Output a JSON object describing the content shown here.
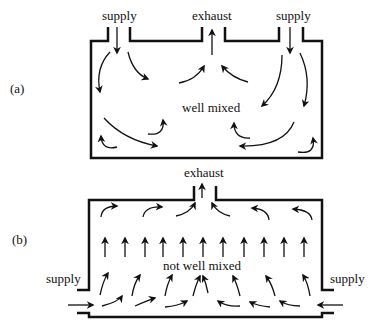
{
  "panel_a": {
    "tag": "(a)",
    "supply_left": "supply",
    "exhaust": "exhaust",
    "supply_right": "supply",
    "center": "well mixed"
  },
  "panel_b": {
    "tag": "(b)",
    "exhaust": "exhaust",
    "supply_left": "supply",
    "supply_right": "supply",
    "center": "not well mixed"
  },
  "colors": {
    "ink": "#111111",
    "background": "#ffffff"
  }
}
